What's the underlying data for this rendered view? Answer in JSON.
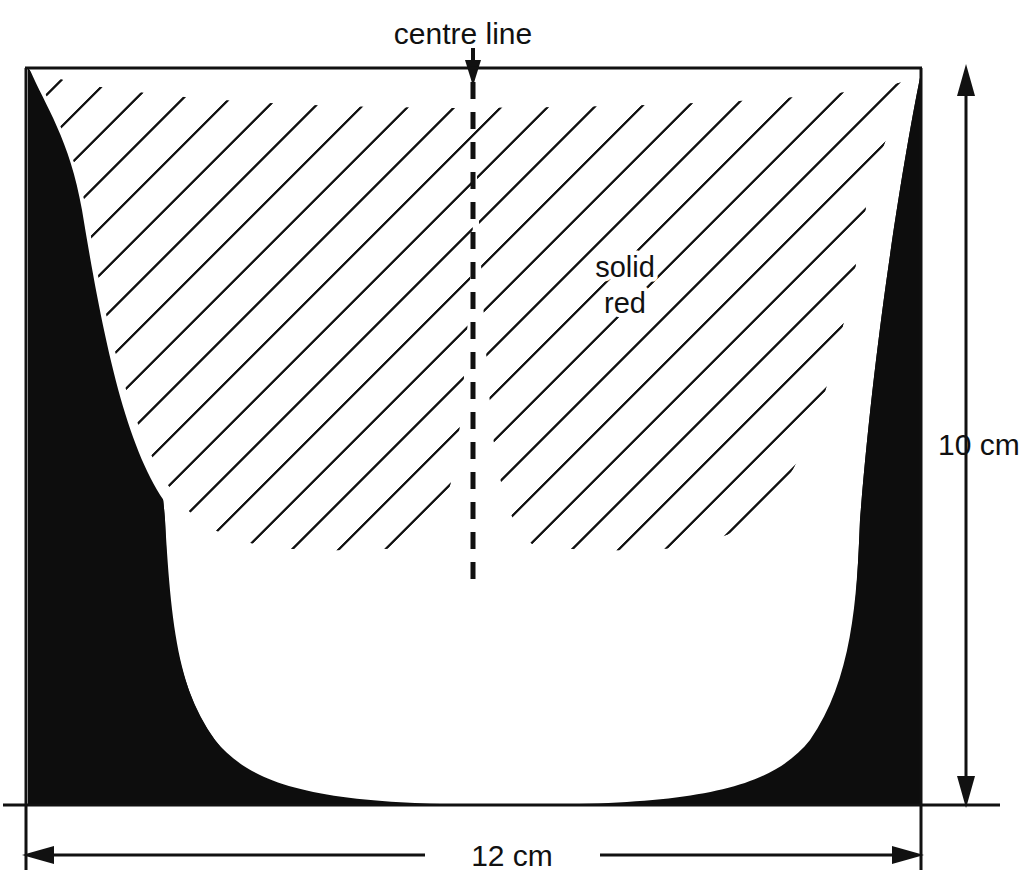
{
  "figure": {
    "background_color": "#ffffff",
    "ink_color": "#111111",
    "solid_fill_color": "#0d0d0d",
    "hatch_color": "#111111"
  },
  "labels": {
    "centre_line": "centre line",
    "material_line1": "solid",
    "material_line2": "red",
    "height_dimension": "10 cm",
    "width_dimension": "12 cm"
  },
  "icons": {
    "centre_line_arrow": "arrow-down-icon",
    "height_arrow_top": "arrow-up-icon",
    "height_arrow_bottom": "arrow-down-icon",
    "width_arrow_left": "arrow-left-icon",
    "width_arrow_right": "arrow-right-icon"
  },
  "measurements": {
    "height_value": 10,
    "height_unit": "cm",
    "width_value": 12,
    "width_unit": "cm"
  },
  "regions": {
    "hatched_region_name": "hatched-core-region",
    "solid_region_name": "solid-red-region",
    "gap_region_name": "white-gap-region"
  }
}
